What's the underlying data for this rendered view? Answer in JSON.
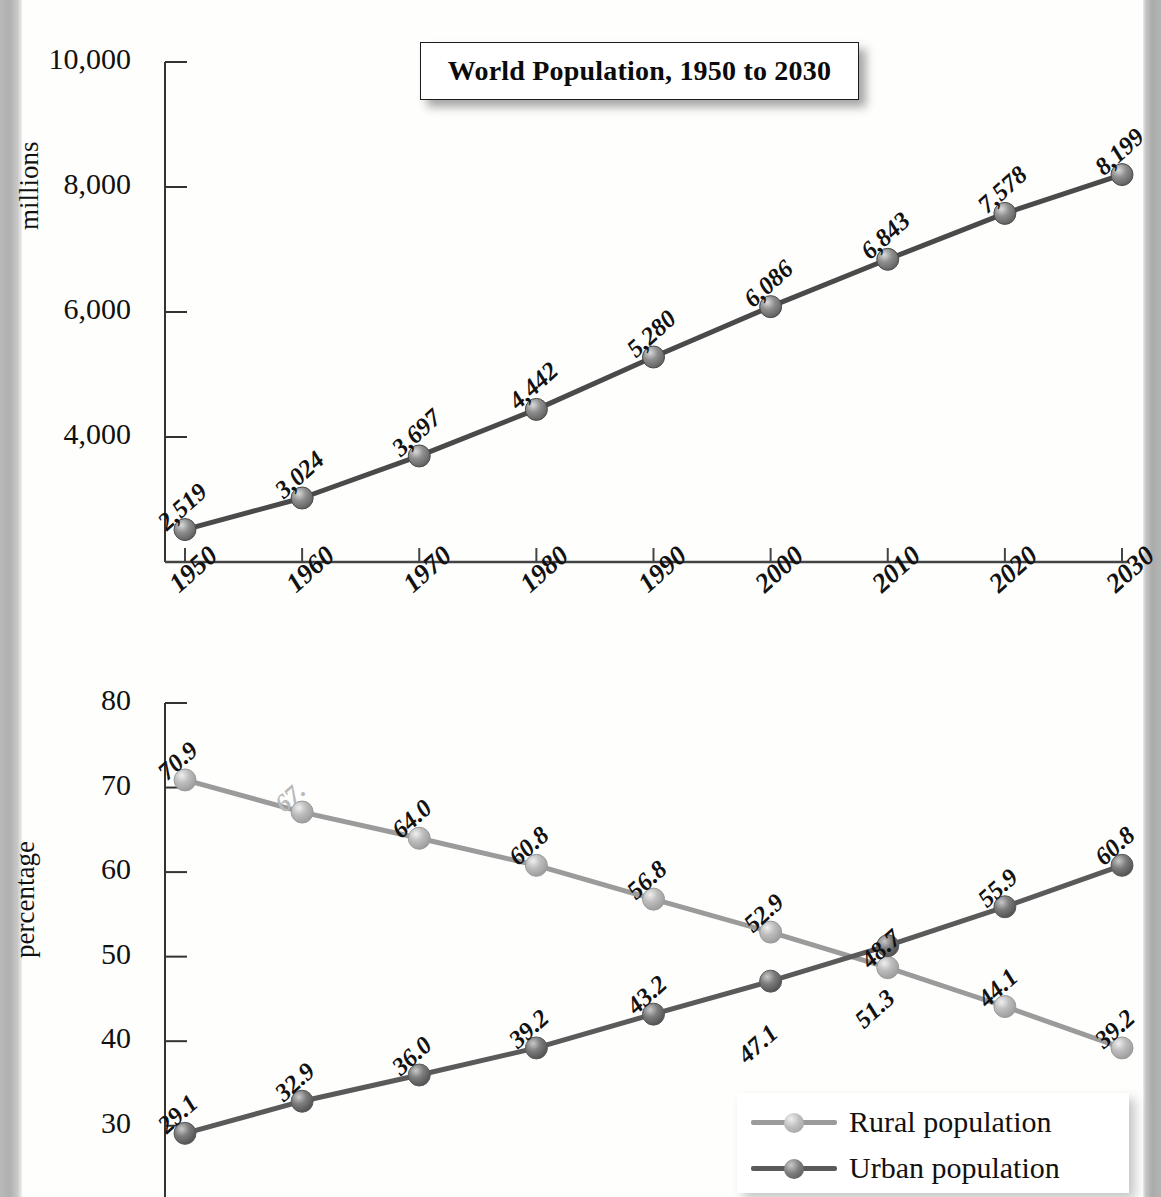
{
  "page": {
    "background_color": "#fefefd",
    "edge_color": "#b4b4b4"
  },
  "charts": {
    "top": {
      "title": "World Population, 1950 to 2030",
      "ylabel": "millions",
      "y_ticks": [
        "10,000",
        "8,000",
        "6,000",
        "4,000"
      ],
      "x_ticks": [
        "1950",
        "1960",
        "1970",
        "1980",
        "1990",
        "2000",
        "2010",
        "2020",
        "2030"
      ],
      "line_color": "#4a4a4a",
      "marker_color": "#7b7b7b"
    },
    "bottom": {
      "title": "World Urban and Rural Population, 1950 to 2030",
      "ylabel": "percentage",
      "y_ticks": [
        "80",
        "70",
        "60",
        "50",
        "40",
        "30"
      ],
      "legend": [
        {
          "label": "Rural population",
          "color": "#9b9b9b"
        },
        {
          "label": "Urban population",
          "color": "#5a5a5a"
        }
      ]
    }
  },
  "chart_data": [
    {
      "type": "line",
      "title": "World Population, 1950 to 2030",
      "xlabel": "",
      "ylabel": "millions",
      "categories": [
        "1950",
        "1960",
        "1970",
        "1980",
        "1990",
        "2000",
        "2010",
        "2020",
        "2030"
      ],
      "values": [
        2519,
        3024,
        3697,
        4442,
        5280,
        6086,
        6843,
        7578,
        8199
      ],
      "point_labels": [
        "2,519",
        "3,024",
        "3,697",
        "4,442",
        "5,280",
        "6,086",
        "6,843",
        "7,578",
        "8,199"
      ],
      "ylim": [
        2000,
        10000
      ],
      "yticks": [
        4000,
        6000,
        8000,
        10000
      ],
      "ytick_labels": [
        "4,000",
        "6,000",
        "8,000",
        "10,000"
      ],
      "grid": false,
      "legend_position": "none",
      "line_color": "#4a4a4a"
    },
    {
      "type": "line",
      "title": "World Urban and Rural Population, 1950 to 2030",
      "xlabel": "",
      "ylabel": "percentage",
      "categories": [
        "1950",
        "1960",
        "1970",
        "1980",
        "1990",
        "2000",
        "2010",
        "2020",
        "2030"
      ],
      "series": [
        {
          "name": "Rural population",
          "color": "#9b9b9b",
          "values": [
            70.9,
            67.1,
            64.0,
            60.8,
            56.8,
            52.9,
            48.7,
            44.1,
            39.2
          ],
          "point_labels": [
            "70.9",
            "67.",
            "64.0",
            "60.8",
            "56.8",
            "52.9",
            "48.7",
            "44.1",
            "39.2"
          ],
          "label_note_1960": "faded in original scan"
        },
        {
          "name": "Urban population",
          "color": "#5a5a5a",
          "values": [
            29.1,
            32.9,
            36.0,
            39.2,
            43.2,
            47.1,
            51.3,
            55.9,
            60.8
          ],
          "point_labels": [
            "29.1",
            "32.9",
            "36.0",
            "39.2",
            "43.2",
            "47.1",
            "51.3",
            "55.9",
            "60.8"
          ]
        }
      ],
      "ylim": [
        25,
        80
      ],
      "yticks": [
        30,
        40,
        50,
        60,
        70,
        80
      ],
      "ytick_labels": [
        "30",
        "40",
        "50",
        "60",
        "70",
        "80"
      ],
      "grid": false,
      "legend_position": "bottom-right"
    }
  ]
}
